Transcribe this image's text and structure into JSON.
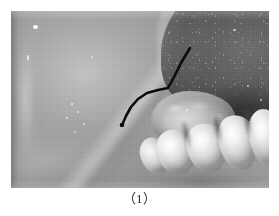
{
  "figure": {
    "caption": "（1）",
    "caption_plain": "(1)",
    "alt_description": "Grayscale intraoral clinical photograph of the right posterior mandible",
    "photo": {
      "frame": {
        "x": 11,
        "y": 11,
        "width": 258,
        "height": 177
      },
      "border_color": "#8c8c8c",
      "background_color": "#ffffff",
      "modality": "grayscale clinical photograph",
      "regions": [
        {
          "name": "buccal-mucosa",
          "label": "Buccal mucosa / cheek",
          "tone": "#b0b0b0",
          "position": "left"
        },
        {
          "name": "tongue-dorsum",
          "label": "Tongue dorsum with papillae",
          "tone": "#5d5d5d",
          "position": "upper-right"
        },
        {
          "name": "operculum",
          "label": "Gingival operculum over partially erupted third molar",
          "tone": "#c6c6c6",
          "position": "center-right"
        },
        {
          "name": "vestibule-shadow",
          "label": "Buccal vestibule shadow",
          "tone": "#3c3c3c",
          "position": "right of operculum"
        },
        {
          "name": "mandibular-molars",
          "label": "Mandibular molar teeth",
          "tone": "#f2f2f2",
          "position": "lower-right",
          "count": 5
        },
        {
          "name": "mucosal-fold",
          "label": "Mucobuccal fold crease",
          "tone": "#9a9a9a",
          "position": "lower-left"
        }
      ],
      "annotation": {
        "name": "lesion-pointer-line",
        "label": "Hand-drawn black marker pointer line",
        "color": "#0a0a0a",
        "stroke_width": 2.6,
        "path": "M 179 37 L 170 52 L 163 66 L 157 77 L 147 79 L 136 82 L 127 88 L 120 96 L 115 105 L 112 112",
        "endpoint_dot": {
          "x": 111,
          "y": 114,
          "radius": 2.3
        }
      }
    }
  }
}
